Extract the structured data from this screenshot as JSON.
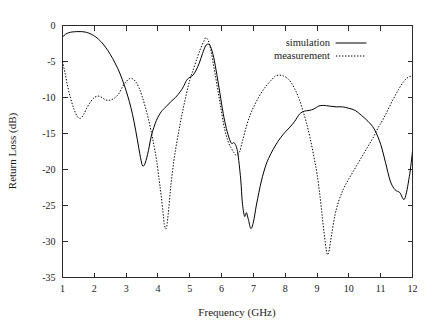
{
  "chart_data": {
    "type": "line",
    "title": "",
    "xlabel": "Frequency (GHz)",
    "ylabel": "Return Loss (dB)",
    "xlim": [
      1,
      12
    ],
    "ylim": [
      -35,
      0
    ],
    "xticks": [
      1,
      2,
      3,
      4,
      5,
      6,
      7,
      8,
      9,
      10,
      11,
      12
    ],
    "yticks": [
      0,
      -5,
      -10,
      -15,
      -20,
      -25,
      -30,
      -35
    ],
    "xtick_labels": [
      "1",
      "2",
      "3",
      "4",
      "5",
      "6",
      "7",
      "8",
      "9",
      "10",
      "11",
      "12"
    ],
    "ytick_labels": [
      "0",
      "-5",
      "-10",
      "-15",
      "-20",
      "-25",
      "-30",
      "-35"
    ],
    "grid": false,
    "legend_position": "top-right-inside",
    "series": [
      {
        "name": "simulation",
        "style": "solid",
        "color": "#000000",
        "x": [
          1.0,
          1.1,
          1.2,
          1.3,
          1.45,
          1.6,
          1.75,
          1.9,
          2.05,
          2.2,
          2.35,
          2.5,
          2.65,
          2.8,
          2.95,
          3.05,
          3.15,
          3.25,
          3.35,
          3.45,
          3.52,
          3.6,
          3.7,
          3.8,
          3.95,
          4.1,
          4.25,
          4.4,
          4.55,
          4.7,
          4.8,
          4.9,
          5.0,
          5.1,
          5.2,
          5.3,
          5.4,
          5.5,
          5.58,
          5.65,
          5.75,
          5.85,
          5.95,
          6.05,
          6.15,
          6.25,
          6.32,
          6.4,
          6.5,
          6.6,
          6.65,
          6.72,
          6.78,
          6.85,
          6.92,
          7.0,
          7.1,
          7.25,
          7.4,
          7.55,
          7.7,
          7.85,
          8.0,
          8.15,
          8.3,
          8.45,
          8.6,
          8.75,
          8.9,
          9.05,
          9.2,
          9.4,
          9.6,
          9.8,
          10.0,
          10.2,
          10.4,
          10.6,
          10.8,
          11.0,
          11.15,
          11.3,
          11.45,
          11.6,
          11.75,
          11.9,
          12.0
        ],
        "y": [
          -1.6,
          -1.2,
          -1.0,
          -0.9,
          -0.85,
          -0.85,
          -0.95,
          -1.2,
          -1.6,
          -2.2,
          -3.0,
          -4.0,
          -5.2,
          -6.6,
          -8.4,
          -9.8,
          -11.4,
          -13.4,
          -15.8,
          -18.3,
          -19.5,
          -19.1,
          -17.4,
          -15.2,
          -13.2,
          -12.0,
          -11.3,
          -10.6,
          -10.0,
          -9.2,
          -8.5,
          -7.6,
          -7.2,
          -6.9,
          -6.2,
          -5.2,
          -3.9,
          -2.8,
          -2.6,
          -2.9,
          -4.4,
          -6.8,
          -9.5,
          -12.2,
          -14.3,
          -15.8,
          -16.4,
          -16.3,
          -17.5,
          -21.3,
          -24.5,
          -26.5,
          -26.0,
          -27.1,
          -28.2,
          -27.3,
          -24.8,
          -21.6,
          -19.3,
          -17.8,
          -16.6,
          -15.6,
          -14.8,
          -14.1,
          -13.3,
          -12.3,
          -11.9,
          -11.8,
          -11.6,
          -11.2,
          -11.1,
          -11.2,
          -11.3,
          -11.3,
          -11.5,
          -11.8,
          -12.5,
          -13.3,
          -14.4,
          -16.5,
          -19.0,
          -21.6,
          -22.8,
          -23.2,
          -24.1,
          -21.0,
          -17.5
        ]
      },
      {
        "name": "measurement",
        "style": "dotted",
        "color": "#000000",
        "x": [
          1.0,
          1.08,
          1.16,
          1.26,
          1.36,
          1.46,
          1.56,
          1.66,
          1.76,
          1.88,
          2.0,
          2.12,
          2.24,
          2.34,
          2.44,
          2.54,
          2.66,
          2.78,
          2.9,
          3.0,
          3.1,
          3.2,
          3.3,
          3.4,
          3.5,
          3.6,
          3.7,
          3.8,
          3.88,
          3.96,
          4.04,
          4.1,
          4.16,
          4.2,
          4.26,
          4.32,
          4.4,
          4.5,
          4.6,
          4.7,
          4.8,
          4.9,
          5.0,
          5.12,
          5.24,
          5.34,
          5.44,
          5.5,
          5.58,
          5.66,
          5.76,
          5.86,
          5.96,
          6.06,
          6.14,
          6.22,
          6.3,
          6.38,
          6.46,
          6.56,
          6.66,
          6.78,
          6.9,
          7.02,
          7.16,
          7.3,
          7.44,
          7.58,
          7.7,
          7.82,
          7.94,
          8.06,
          8.18,
          8.3,
          8.42,
          8.54,
          8.66,
          8.78,
          8.9,
          9.0,
          9.1,
          9.18,
          9.26,
          9.32,
          9.38,
          9.46,
          9.56,
          9.68,
          9.82,
          9.96,
          10.12,
          10.28,
          10.44,
          10.6,
          10.76,
          10.92,
          11.08,
          11.24,
          11.4,
          11.56,
          11.72,
          11.86,
          12.0
        ],
        "y": [
          -5.0,
          -6.6,
          -8.4,
          -10.2,
          -11.6,
          -12.6,
          -12.9,
          -12.4,
          -11.5,
          -10.6,
          -10.0,
          -9.8,
          -10.0,
          -10.3,
          -10.4,
          -10.3,
          -10.0,
          -9.4,
          -8.4,
          -7.8,
          -7.4,
          -7.4,
          -7.8,
          -8.6,
          -9.8,
          -11.3,
          -13.0,
          -15.0,
          -16.8,
          -18.8,
          -21.5,
          -23.6,
          -26.0,
          -27.6,
          -28.2,
          -26.3,
          -22.5,
          -18.8,
          -16.0,
          -13.6,
          -11.4,
          -9.4,
          -7.6,
          -6.0,
          -4.4,
          -3.2,
          -2.2,
          -1.7,
          -2.1,
          -3.4,
          -5.8,
          -8.4,
          -11.0,
          -13.6,
          -15.2,
          -16.3,
          -17.0,
          -17.6,
          -18.0,
          -17.6,
          -16.0,
          -14.0,
          -12.4,
          -11.2,
          -10.0,
          -9.0,
          -8.2,
          -7.5,
          -7.0,
          -6.9,
          -7.0,
          -7.3,
          -7.9,
          -8.8,
          -10.0,
          -11.6,
          -13.4,
          -15.6,
          -18.2,
          -20.6,
          -24.0,
          -27.2,
          -30.2,
          -31.8,
          -31.2,
          -29.0,
          -26.4,
          -24.4,
          -22.8,
          -21.6,
          -20.4,
          -19.2,
          -18.0,
          -16.8,
          -15.6,
          -14.2,
          -13.0,
          -11.6,
          -10.2,
          -8.9,
          -7.8,
          -7.2,
          -7.0
        ]
      }
    ]
  },
  "legend": {
    "entries": [
      {
        "label": "simulation",
        "style": "solid"
      },
      {
        "label": "measurement",
        "style": "dotted"
      }
    ]
  }
}
